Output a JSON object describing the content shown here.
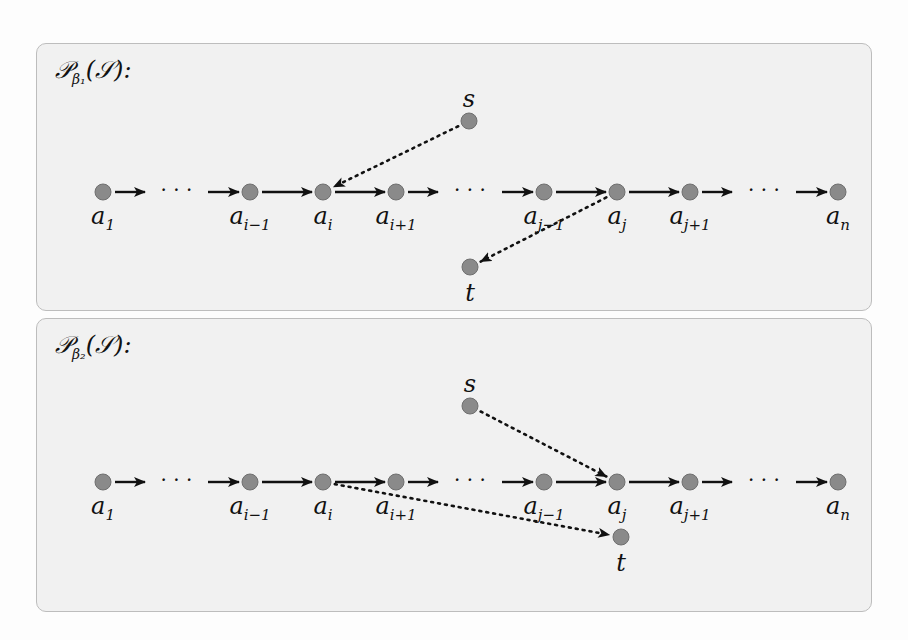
{
  "figure": {
    "panels": [
      {
        "id": "beta1",
        "title_main": "𝒫",
        "title_sub": "β₁",
        "title_rest": "(𝒮):",
        "chain": [
          {
            "label": "a",
            "sub": "1",
            "x": 103
          },
          {
            "label": "a",
            "sub": "i−1",
            "x": 250
          },
          {
            "label": "a",
            "sub": "i",
            "x": 323
          },
          {
            "label": "a",
            "sub": "i+1",
            "x": 396
          },
          {
            "label": "a",
            "sub": "j−1",
            "x": 544
          },
          {
            "label": "a",
            "sub": "j",
            "x": 617
          },
          {
            "label": "a",
            "sub": "j+1",
            "x": 690
          },
          {
            "label": "a",
            "sub": "n",
            "x": 838
          }
        ],
        "ellipsis_after": [
          "1",
          "i+1",
          "j+1"
        ],
        "source": {
          "label": "s",
          "target": "a_i"
        },
        "sink": {
          "label": "t",
          "from": "a_j"
        }
      },
      {
        "id": "beta2",
        "title_main": "𝒫",
        "title_sub": "β₂",
        "title_rest": "(𝒮):",
        "chain": [
          {
            "label": "a",
            "sub": "1",
            "x": 103
          },
          {
            "label": "a",
            "sub": "i−1",
            "x": 250
          },
          {
            "label": "a",
            "sub": "i",
            "x": 323
          },
          {
            "label": "a",
            "sub": "i+1",
            "x": 396
          },
          {
            "label": "a",
            "sub": "j−1",
            "x": 544
          },
          {
            "label": "a",
            "sub": "j",
            "x": 617
          },
          {
            "label": "a",
            "sub": "j+1",
            "x": 690
          },
          {
            "label": "a",
            "sub": "n",
            "x": 838
          }
        ],
        "ellipsis_after": [
          "1",
          "i+1",
          "j+1"
        ],
        "source": {
          "label": "s",
          "target": "a_j"
        },
        "sink": {
          "label": "t",
          "from": "a_i"
        }
      }
    ],
    "colors": {
      "node_fill": "#8a8a8a",
      "node_stroke": "#6f6f6f",
      "edge": "#111111",
      "panel_bg": "#f1f1f1",
      "panel_border": "#bdbdbd"
    }
  }
}
